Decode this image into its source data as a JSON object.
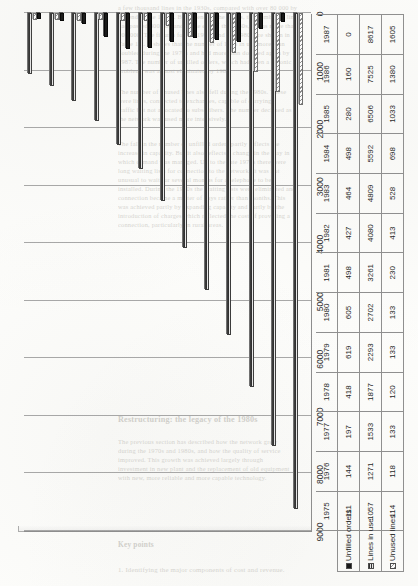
{
  "page": {
    "background_color": "#fdfdfb",
    "bleed_text_color": "#b9b7b1",
    "bleed_lines": [
      "a few thousand lines in the 1930s, compared with over 80 000 by",
      "the end of the 1940s. By the end of the 1950s, the number of lines",
      "had passed 300 000 and at the end of the 1960s, it was more than",
      "900 000. The figures for the 1970s and the 1980s are shown in",
      "Table 1.2. It shows that the number of lines in use more than",
      "doubled during the 1970s and had more than doubled again by",
      "1987. The number of unfilled orders, which had been a chronic",
      "problem, was almost eliminated by 1987.",
      "The number of unused lines also fell during the 1980s. These",
      "were lines, connected to exchanges, capable of carrying",
      "traffic but not allocated to subscribers. The number declined as",
      "the network was used more intensively.",
      "The fall in the number of unfilled orders partly reflects the",
      "increase in capacity. But it also reflects a change in the way in",
      "which demand was managed. Up to the late 1970s there were",
      "long waiting lists for connection to the network. It was not",
      "unusual to wait for several months for a telephone to be",
      "installed. During the 1980s the waiting lists were eliminated and",
      "connection became a matter of days rather than months. This",
      "was achieved partly by expanding capacity and partly by the",
      "introduction of charges which reflected the cost of providing a",
      "connection, particularly in rural areas.",
      "Restructuring: the legacy of the 1980s",
      "The previous section has described how the network grew",
      "during the 1970s and 1980s, and how the quality of service",
      "improved. This growth was achieved largely through",
      "investment in new plant and the replacement of old equipment",
      "with new, more reliable and more capable technology.",
      "Key points",
      "1. Identifying the major components of cost and revenue."
    ]
  },
  "chart": {
    "value_axis": {
      "ticks": [
        "9000",
        "8000",
        "7000",
        "6000",
        "5000",
        "4000",
        "3000",
        "2000",
        "1000",
        "0"
      ],
      "max": 9000,
      "min": 0,
      "reversed": true,
      "grid": true
    },
    "legend": [
      {
        "label": "Unfilled orders",
        "swatch": "solid-black-swatch"
      },
      {
        "label": "Lines in use",
        "swatch": "striped-dark-swatch"
      },
      {
        "label": "Unused lines",
        "swatch": "hatched-light-swatch"
      }
    ]
  },
  "chart_data": {
    "type": "bar",
    "title": "",
    "xlabel": "",
    "ylabel": "",
    "orientation": "horizontal-rotated-90ccw",
    "categories": [
      "1975",
      "1976",
      "1977",
      "1978",
      "1979",
      "1980",
      "1981",
      "1982",
      "1983",
      "1984",
      "1985",
      "1986",
      "1987"
    ],
    "series": [
      {
        "name": "Unfilled orders",
        "color": "#141414",
        "pattern": "solid",
        "values": [
          111,
          144,
          197,
          418,
          619,
          605,
          498,
          427,
          464,
          498,
          280,
          160,
          0
        ]
      },
      {
        "name": "Lines in use",
        "color": "#2e2e2e",
        "pattern": "horizontal-stripes",
        "values": [
          1057,
          1271,
          1533,
          1877,
          2293,
          2702,
          3261,
          4080,
          4809,
          5592,
          6506,
          7525,
          8617
        ]
      },
      {
        "name": "Unused lines",
        "color": "#8d8d8d",
        "pattern": "diagonal-hatch",
        "values": [
          114,
          118,
          133,
          120,
          133,
          133,
          230,
          413,
          528,
          698,
          1033,
          1380,
          1605
        ]
      }
    ],
    "ylim": [
      0,
      9000
    ],
    "grid": true,
    "legend_position": "bottom-left-in-table",
    "data_table": true
  }
}
